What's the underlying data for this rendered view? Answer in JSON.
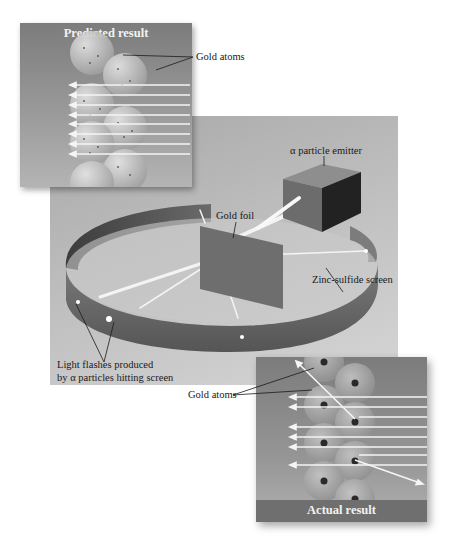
{
  "figure": {
    "colors": {
      "background": "#ffffff",
      "panel_bg": "#9c9c9c",
      "inset_bg": "#8a8a8a",
      "caption_bar": "#6f6f6f",
      "screen_band": "#6a6a6a",
      "beam": "#f5f5f5",
      "text": "#1a1a1a"
    }
  },
  "predicted_panel": {
    "caption": "Predicted result",
    "atom_label": "Gold atoms",
    "arrow_count": 8,
    "description": "All alpha particles pass straight through the gold atoms"
  },
  "apparatus": {
    "emitter_label": "α particle emitter",
    "foil_label": "Gold foil",
    "screen_label": "Zinc-sulfide screen",
    "flash_label_line1": "Light flashes produced",
    "flash_label_line2": "by α particles hitting screen"
  },
  "actual_panel": {
    "caption": "Actual result",
    "atom_label": "Gold atoms",
    "arrow_count": 10,
    "description": "Most alpha particles pass through; some are deflected by dense nuclei"
  }
}
